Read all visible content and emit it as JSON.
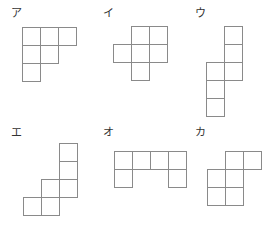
{
  "figures": [
    {
      "label": "ア",
      "label_pos": [
        11,
        8
      ],
      "origin": [
        22,
        27
      ],
      "size": 18,
      "cells": [
        [
          0,
          0
        ],
        [
          1,
          0
        ],
        [
          2,
          0
        ],
        [
          0,
          1
        ],
        [
          1,
          1
        ],
        [
          0,
          2
        ]
      ]
    },
    {
      "label": "イ",
      "label_pos": [
        103,
        8
      ],
      "origin": [
        113,
        26
      ],
      "size": 18,
      "cells": [
        [
          1,
          0
        ],
        [
          2,
          0
        ],
        [
          0,
          1
        ],
        [
          1,
          1
        ],
        [
          2,
          1
        ],
        [
          1,
          2
        ]
      ]
    },
    {
      "label": "ウ",
      "label_pos": [
        195,
        8
      ],
      "origin": [
        206,
        26
      ],
      "size": 18,
      "cells": [
        [
          1,
          0
        ],
        [
          1,
          1
        ],
        [
          1,
          2
        ],
        [
          0,
          2
        ],
        [
          0,
          3
        ],
        [
          0,
          4
        ]
      ]
    },
    {
      "label": "エ",
      "label_pos": [
        11,
        127
      ],
      "origin": [
        23,
        143
      ],
      "size": 18,
      "cells": [
        [
          2,
          0
        ],
        [
          2,
          1
        ],
        [
          2,
          2
        ],
        [
          1,
          2
        ],
        [
          1,
          3
        ],
        [
          0,
          3
        ]
      ]
    },
    {
      "label": "オ",
      "label_pos": [
        103,
        127
      ],
      "origin": [
        114,
        151
      ],
      "size": 18,
      "cells": [
        [
          0,
          0
        ],
        [
          1,
          0
        ],
        [
          2,
          0
        ],
        [
          3,
          0
        ],
        [
          0,
          1
        ],
        [
          3,
          1
        ]
      ]
    },
    {
      "label": "カ",
      "label_pos": [
        195,
        127
      ],
      "origin": [
        207,
        151
      ],
      "size": 18,
      "cells": [
        [
          1,
          0
        ],
        [
          2,
          0
        ],
        [
          0,
          1
        ],
        [
          1,
          1
        ],
        [
          0,
          2
        ],
        [
          1,
          2
        ]
      ]
    }
  ],
  "colors": {
    "stroke": "#8a8a8a",
    "label": "#333333",
    "background": "#ffffff"
  }
}
